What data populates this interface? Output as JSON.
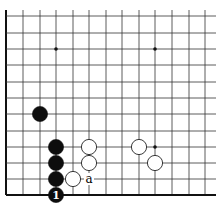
{
  "diagram": {
    "type": "go-board-corner",
    "grid": {
      "x_lines": [
        6,
        23,
        40,
        56,
        73,
        89,
        106,
        122,
        139,
        155,
        172,
        189,
        205
      ],
      "y_lines": [
        16,
        33,
        49,
        65,
        82,
        98,
        114,
        131,
        147,
        163,
        179,
        195
      ],
      "left_edge": true,
      "bottom_edge": true,
      "line_color": "#333333",
      "edge_color": "#111111"
    },
    "star_points": [
      {
        "col": 3,
        "row": 2
      },
      {
        "col": 9,
        "row": 2
      },
      {
        "col": 9,
        "row": 8
      }
    ],
    "stones": [
      {
        "color": "black",
        "col": 2,
        "row": 6,
        "label": ""
      },
      {
        "color": "black",
        "col": 3,
        "row": 8,
        "label": ""
      },
      {
        "color": "black",
        "col": 3,
        "row": 9,
        "label": ""
      },
      {
        "color": "black",
        "col": 3,
        "row": 10,
        "label": ""
      },
      {
        "color": "black",
        "col": 3,
        "row": 11,
        "label": "1"
      },
      {
        "color": "white",
        "col": 5,
        "row": 8,
        "label": ""
      },
      {
        "color": "white",
        "col": 5,
        "row": 9,
        "label": ""
      },
      {
        "color": "white",
        "col": 4,
        "row": 10,
        "label": ""
      },
      {
        "color": "white",
        "col": 8,
        "row": 8,
        "label": ""
      },
      {
        "color": "white",
        "col": 9,
        "row": 9,
        "label": ""
      }
    ],
    "annotations": [
      {
        "text": "a",
        "col": 5,
        "row": 10
      }
    ]
  }
}
